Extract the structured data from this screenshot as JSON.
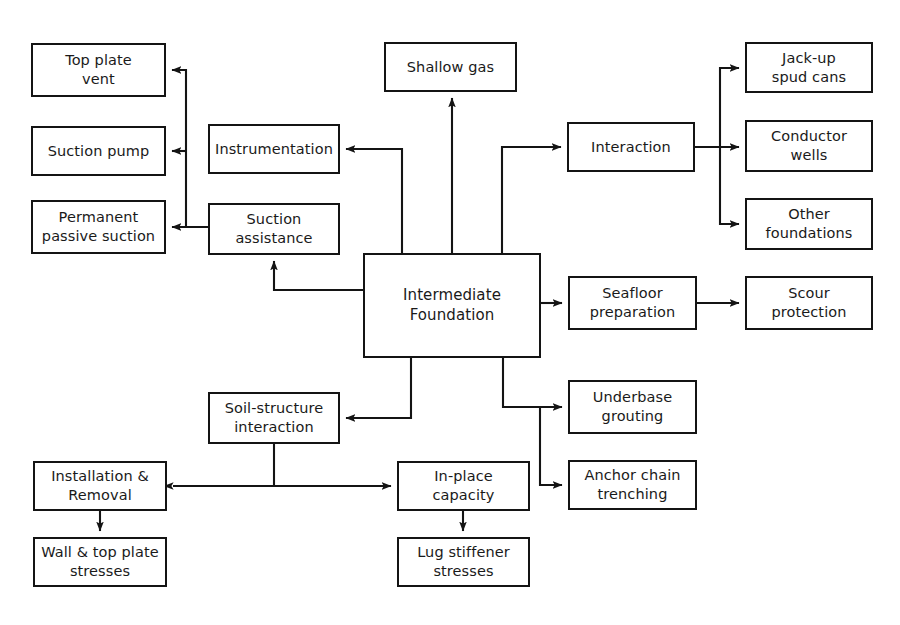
{
  "diagram": {
    "line_color": "#141414",
    "box_fill": "#ffffff",
    "text_color": "#1a1a1a",
    "nodes": [
      {
        "id": "top_plate_vent",
        "label": "Top plate\nvent",
        "x": 31,
        "y": 43,
        "w": 135,
        "h": 54
      },
      {
        "id": "suction_pump",
        "label": "Suction pump",
        "x": 31,
        "y": 126,
        "w": 135,
        "h": 50
      },
      {
        "id": "permanent_passive",
        "label": "Permanent\npassive suction",
        "x": 31,
        "y": 200,
        "w": 135,
        "h": 54
      },
      {
        "id": "instrumentation",
        "label": "Instrumentation",
        "x": 208,
        "y": 124,
        "w": 132,
        "h": 50
      },
      {
        "id": "suction_assistance",
        "label": "Suction\nassistance",
        "x": 208,
        "y": 203,
        "w": 132,
        "h": 52
      },
      {
        "id": "shallow_gas",
        "label": "Shallow gas",
        "x": 384,
        "y": 42,
        "w": 133,
        "h": 50
      },
      {
        "id": "intermediate_found",
        "label": "Intermediate\nFoundation",
        "x": 363,
        "y": 253,
        "w": 178,
        "h": 105
      },
      {
        "id": "interaction",
        "label": "Interaction",
        "x": 567,
        "y": 122,
        "w": 128,
        "h": 50
      },
      {
        "id": "jackup_spud_cans",
        "label": "Jack-up\nspud cans",
        "x": 745,
        "y": 42,
        "w": 128,
        "h": 51
      },
      {
        "id": "conductor_wells",
        "label": "Conductor\nwells",
        "x": 745,
        "y": 120,
        "w": 128,
        "h": 52
      },
      {
        "id": "other_foundations",
        "label": "Other\nfoundations",
        "x": 745,
        "y": 198,
        "w": 128,
        "h": 52
      },
      {
        "id": "seafloor_preparation",
        "label": "Seafloor\npreparation",
        "x": 568,
        "y": 276,
        "w": 129,
        "h": 54
      },
      {
        "id": "scour_protection",
        "label": "Scour\nprotection",
        "x": 745,
        "y": 276,
        "w": 128,
        "h": 54
      },
      {
        "id": "underbase_grouting",
        "label": "Underbase\ngrouting",
        "x": 568,
        "y": 380,
        "w": 129,
        "h": 54
      },
      {
        "id": "anchor_chain_trench",
        "label": "Anchor chain\ntrenching",
        "x": 568,
        "y": 460,
        "w": 129,
        "h": 50
      },
      {
        "id": "soil_structure",
        "label": "Soil-structure\ninteraction",
        "x": 208,
        "y": 392,
        "w": 132,
        "h": 52
      },
      {
        "id": "installation_removal",
        "label": "Installation &\nRemoval",
        "x": 33,
        "y": 461,
        "w": 134,
        "h": 50
      },
      {
        "id": "wall_top_plate",
        "label": "Wall & top plate\nstresses",
        "x": 33,
        "y": 537,
        "w": 134,
        "h": 50
      },
      {
        "id": "in_place_capacity",
        "label": "In-place\ncapacity",
        "x": 397,
        "y": 461,
        "w": 133,
        "h": 50
      },
      {
        "id": "lug_stiffener",
        "label": "Lug stiffener\nstresses",
        "x": 397,
        "y": 537,
        "w": 133,
        "h": 50
      }
    ],
    "edges": [
      {
        "id": "center-to-shallow-gas",
        "from": "intermediate_found",
        "to": "shallow_gas",
        "points": "452,253 452,98",
        "arrow": "end"
      },
      {
        "id": "center-to-instrumentation",
        "from": "intermediate_found",
        "to": "instrumentation",
        "points": "402,253 402,149 346,149",
        "arrow": "end"
      },
      {
        "id": "center-to-interaction",
        "from": "intermediate_found",
        "to": "interaction",
        "points": "502,253 502,147 561,147",
        "arrow": "end"
      },
      {
        "id": "center-to-suction-assistance",
        "from": "intermediate_found",
        "to": "suction_assistance",
        "points": "363,290 274,290 274,261",
        "arrow": "end"
      },
      {
        "id": "center-to-seafloor-prep",
        "from": "intermediate_found",
        "to": "seafloor_preparation",
        "points": "541,303 562,303",
        "arrow": "end"
      },
      {
        "id": "center-to-soil-structure",
        "from": "intermediate_found",
        "to": "soil_structure",
        "points": "411,358 411,418 346,418",
        "arrow": "end"
      },
      {
        "id": "center-to-underbase",
        "from": "intermediate_found",
        "to": "underbase_grouting",
        "points": "503,358 503,407 562,407",
        "arrow": "end"
      },
      {
        "id": "center-to-anchor-chain",
        "from": "intermediate_found",
        "to": "anchor_chain_trench",
        "points": "540,407 540,485 562,485",
        "arrow": "end"
      },
      {
        "id": "suction-to-topplate-trunk",
        "from": "suction_assistance",
        "to": "permanent_passive",
        "points": "208,227 186,227 172,227",
        "arrow": "end"
      },
      {
        "id": "trunk-to-top-plate-vent",
        "from": "suction_assistance",
        "to": "top_plate_vent",
        "points": "186,227 186,70 172,70",
        "arrow": "end"
      },
      {
        "id": "trunk-to-suction-pump",
        "from": "suction_assistance",
        "to": "suction_pump",
        "points": "186,151 172,151",
        "arrow": "end"
      },
      {
        "id": "interaction-to-trunk",
        "from": "interaction",
        "to": "conductor_wells",
        "points": "695,147 739,147",
        "arrow": "end"
      },
      {
        "id": "trunk-to-jackup",
        "from": "interaction",
        "to": "jackup_spud_cans",
        "points": "720,147 720,68 739,68",
        "arrow": "end"
      },
      {
        "id": "trunk-to-other-foundations",
        "from": "interaction",
        "to": "other_foundations",
        "points": "720,147 720,224 739,224",
        "arrow": "end"
      },
      {
        "id": "seafloor-to-scour",
        "from": "seafloor_preparation",
        "to": "scour_protection",
        "points": "697,303 739,303",
        "arrow": "end"
      },
      {
        "id": "soil-structure-stem",
        "from": "soil_structure",
        "to": "in_place_capacity",
        "points": "274,444 274,486",
        "arrow": "none"
      },
      {
        "id": "install-inplace-double-arrow",
        "from": "installation_removal",
        "to": "in_place_capacity",
        "points": "173,486 391,486",
        "arrow": "both"
      },
      {
        "id": "install-to-wall-stresses",
        "from": "installation_removal",
        "to": "wall_top_plate",
        "points": "100,511 100,531",
        "arrow": "end"
      },
      {
        "id": "inplace-to-lug-stiffener",
        "from": "in_place_capacity",
        "to": "lug_stiffener",
        "points": "463,511 463,531",
        "arrow": "end"
      }
    ]
  }
}
